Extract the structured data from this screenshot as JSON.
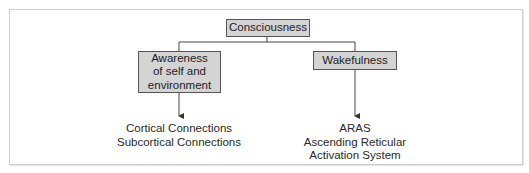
{
  "diagram": {
    "root": {
      "label": "Consciousness"
    },
    "branches": [
      {
        "label_lines": [
          "Awareness",
          "of self and",
          "environment"
        ],
        "leaf_lines": [
          "Cortical Connections",
          "Subcortical Connections"
        ]
      },
      {
        "label_lines": [
          "Wakefulness"
        ],
        "leaf_lines": [
          "ARAS",
          "Ascending Reticular",
          "Activation System"
        ]
      }
    ],
    "colors": {
      "box_fill": "#d4d4d4",
      "box_border": "#555555",
      "line": "#444444",
      "frame": "#cfcfcf"
    }
  }
}
